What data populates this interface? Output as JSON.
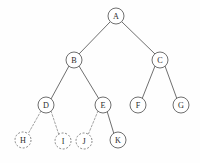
{
  "figure": {
    "width": 200,
    "height": 163,
    "background_color": "#fefefe"
  },
  "style": {
    "node_radius": 8,
    "solid_stroke_color": "#4a4a4a",
    "dashed_stroke_color": "#8c8c8c",
    "node_fill_color": "#ffffff",
    "label_color": "#2b2b2b"
  },
  "tree": {
    "nodes": [
      {
        "id": "A",
        "label": "A",
        "x": 116,
        "y": 16,
        "r": 8,
        "style": "solid"
      },
      {
        "id": "B",
        "label": "B",
        "x": 74,
        "y": 60,
        "r": 8,
        "style": "solid"
      },
      {
        "id": "C",
        "label": "C",
        "x": 160,
        "y": 60,
        "r": 8,
        "style": "solid"
      },
      {
        "id": "D",
        "label": "D",
        "x": 46,
        "y": 105,
        "r": 8,
        "style": "solid"
      },
      {
        "id": "E",
        "label": "E",
        "x": 103,
        "y": 105,
        "r": 8,
        "style": "solid"
      },
      {
        "id": "F",
        "label": "F",
        "x": 138,
        "y": 105,
        "r": 8,
        "style": "solid"
      },
      {
        "id": "G",
        "label": "G",
        "x": 181,
        "y": 105,
        "r": 8,
        "style": "solid"
      },
      {
        "id": "H",
        "label": "H",
        "x": 23,
        "y": 140,
        "r": 8,
        "style": "dashed"
      },
      {
        "id": "I",
        "label": "I",
        "x": 63,
        "y": 141,
        "r": 8,
        "style": "dashed"
      },
      {
        "id": "J",
        "label": "J",
        "x": 84,
        "y": 141,
        "r": 8,
        "style": "dashed"
      },
      {
        "id": "K",
        "label": "K",
        "x": 118,
        "y": 140,
        "r": 8,
        "style": "solid"
      }
    ],
    "edges": [
      {
        "from": "A",
        "to": "B",
        "x1": 110,
        "y1": 22,
        "x2": 79,
        "y2": 54,
        "style": "solid"
      },
      {
        "from": "A",
        "to": "C",
        "x1": 122,
        "y1": 22,
        "x2": 155,
        "y2": 54,
        "style": "solid"
      },
      {
        "from": "B",
        "to": "D",
        "x1": 69,
        "y1": 66,
        "x2": 51,
        "y2": 99,
        "style": "solid"
      },
      {
        "from": "B",
        "to": "E",
        "x1": 79,
        "y1": 66,
        "x2": 99,
        "y2": 99,
        "style": "solid"
      },
      {
        "from": "C",
        "to": "F",
        "x1": 155,
        "y1": 66,
        "x2": 142,
        "y2": 99,
        "style": "solid"
      },
      {
        "from": "C",
        "to": "G",
        "x1": 165,
        "y1": 66,
        "x2": 177,
        "y2": 99,
        "style": "solid"
      },
      {
        "from": "D",
        "to": "H",
        "x1": 41,
        "y1": 111,
        "x2": 28,
        "y2": 134,
        "style": "dashed"
      },
      {
        "from": "D",
        "to": "I",
        "x1": 51,
        "y1": 111,
        "x2": 59,
        "y2": 135,
        "style": "dashed"
      },
      {
        "from": "E",
        "to": "J",
        "x1": 98,
        "y1": 111,
        "x2": 88,
        "y2": 135,
        "style": "dashed"
      },
      {
        "from": "E",
        "to": "K",
        "x1": 107,
        "y1": 111,
        "x2": 114,
        "y2": 134,
        "style": "solid"
      }
    ]
  }
}
